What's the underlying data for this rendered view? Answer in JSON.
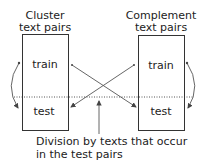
{
  "diagram": {
    "left_group": {
      "title_line1": "Cluster",
      "title_line2": "text pairs",
      "top_label": "train",
      "bottom_label": "test"
    },
    "right_group": {
      "title_line1": "Complement",
      "title_line2": "text pairs",
      "top_label": "train",
      "bottom_label": "test"
    },
    "caption_line1": "Division by texts that occur",
    "caption_line2": "in the test pairs",
    "colors": {
      "stroke": "#333333",
      "arrow": "#555555",
      "text": "#222222",
      "background": "#ffffff"
    }
  }
}
